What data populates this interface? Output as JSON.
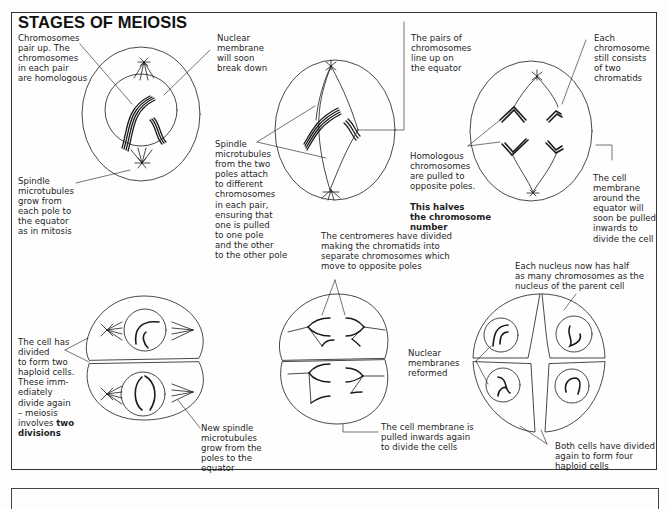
{
  "title": "STAGES OF MEIOSIS",
  "labels": {
    "chromosomes_pair": "Chromosomes\npair up. The\nchromosomes\nin each pair\nare homologous",
    "nuclear_membrane_breakdown": "Nuclear\nmembrane\nwill soon\nbreak down",
    "spindle_grow": "Spindle\nmicrotubules\ngrow from\neach pole to\nthe equator\nas in mitosis",
    "pairs_line_up": "The pairs of\nchromosomes\nline up on\nthe equator",
    "spindle_attach": "Spindle\nmicrotubules\nfrom the two\npoles attach\nto different\nchromosomes\nin each pair,\nensuring that\none is pulled\nto one pole\nand the other\nto the other pole",
    "each_chromosome": "Each\nchromosome\nstill consists\nof two\nchromatids",
    "homologous_pulled": "Homologous\nchromosomes\nare pulled to\nopposite poles.",
    "homologous_pulled_bold": "This halves\nthe chromosome\nnumber",
    "cell_membrane_equator": "The cell\nmembrane\naround the\nequator will\nsoon be pulled\ninwards to\ndivide the cell",
    "cell_divided": "The cell has\ndivided\nto form two\nhaploid cells.\nThese imm-\nediately\ndivide again\n– meiosis\ninvolves ",
    "cell_divided_bold": "two\ndivisions",
    "new_spindle": "New spindle\nmicrotubules\ngrow from the\npoles to the\nequator",
    "centromeres_divided": "The centromeres have divided\nmaking the chromatids into\nseparate chromosomes which\nmove to opposite poles",
    "cell_membrane_again": "The cell membrane is\npulled inwards again\nto divide the cells",
    "nuclear_membranes_reformed": "Nuclear\nmembranes\nreformed",
    "each_nucleus_half": "Each nucleus now has half\nas many chromosomes as the\nnucleus of the parent cell",
    "four_haploid": "Both cells have divided\nagain to form four\nhaploid cells"
  },
  "colors": {
    "ink": "#1a1a1a",
    "border": "#333333",
    "background": "#fefefe"
  }
}
